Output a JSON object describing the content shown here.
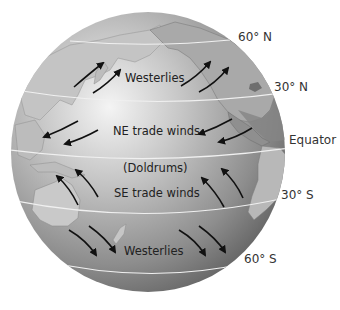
{
  "diagram": {
    "colors": {
      "globe_light": "#e6e6e6",
      "globe_dark": "#6f6f6f",
      "land": "#b9b9b9",
      "land_dark": "#7d7d7d",
      "latitude_line": "#f2f2f2",
      "arrow": "#111111",
      "text": "#222222"
    },
    "latitude_labels": [
      {
        "id": "lat-60n",
        "text": "60° N"
      },
      {
        "id": "lat-30n",
        "text": "30° N"
      },
      {
        "id": "lat-eq",
        "text": "Equator"
      },
      {
        "id": "lat-30s",
        "text": "30° S"
      },
      {
        "id": "lat-60s",
        "text": "60° S"
      }
    ],
    "wind_labels": [
      {
        "id": "westerlies-north",
        "text": "Westerlies",
        "arrow_direction": "southwest-to-northeast"
      },
      {
        "id": "ne-trade-winds",
        "text": "NE trade winds",
        "arrow_direction": "northeast-to-southwest"
      },
      {
        "id": "doldrums",
        "text": "(Doldrums)",
        "arrow_direction": "none"
      },
      {
        "id": "se-trade-winds",
        "text": "SE trade winds",
        "arrow_direction": "southeast-to-northwest"
      },
      {
        "id": "westerlies-south",
        "text": "Westerlies",
        "arrow_direction": "northwest-to-southeast"
      }
    ]
  }
}
